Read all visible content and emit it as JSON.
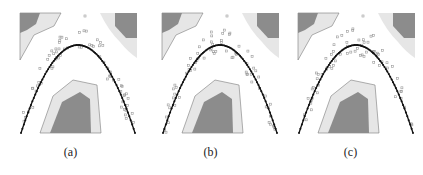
{
  "figure": {
    "panels": [
      {
        "id": "a",
        "caption": "(a)",
        "offset_x": 0
      },
      {
        "id": "b",
        "caption": "(b)",
        "offset_x": 140
      },
      {
        "id": "c",
        "caption": "(c)",
        "offset_x": 280
      }
    ],
    "colors": {
      "region_light": "#e6e6e6",
      "region_dark": "#8c8c8c",
      "region_edge": "#7a7a7a",
      "curve": "#111111",
      "scatter": "#9a9a9a"
    },
    "elements": {
      "curve": "inverted parabola (black dotted line)",
      "regions": [
        "top-left region",
        "top-right region",
        "bottom-center region"
      ],
      "scatter": "gray sample points around the curve"
    }
  }
}
